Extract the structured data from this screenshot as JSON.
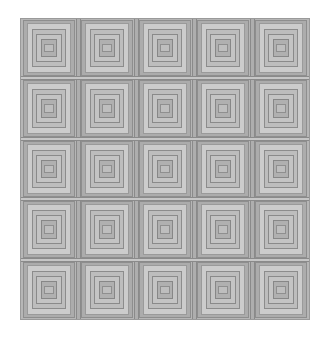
{
  "image": {
    "title": "Tiled nested-square grayscale pattern",
    "background_color": "#ffffff",
    "width": 329,
    "height": 338
  },
  "pattern": {
    "name": "nested-square-tiling",
    "columns": 5,
    "rows": 5,
    "origin_x": 20,
    "origin_y": 18,
    "area_width": 290,
    "area_height": 302,
    "tile_width": 58,
    "tile_height": 60.4,
    "border_color": "#9a9a9a",
    "base_color": "#b4b4b4",
    "seam_color_vertical": "#aeaeae",
    "seam_color_horizontal": "#c6c6c6",
    "outline_color": "#8e8e8e"
  },
  "tile_bands": [
    {
      "name": "outer-field",
      "inset_x": 0,
      "inset_y": 0,
      "color": "#b6b6b6",
      "outline": "#949494"
    },
    {
      "name": "outer-frame",
      "inset_x": 3,
      "inset_y": 2,
      "color": "#acacac",
      "outline": "#8e8e8e"
    },
    {
      "name": "light-cap",
      "inset_x": 7,
      "inset_y": 5,
      "color": "#cccccc",
      "outline": "#9a9a9a"
    },
    {
      "name": "mid-frame",
      "inset_x": 12,
      "inset_y": 11,
      "color": "#bdbdbd",
      "outline": "#8c8c8c"
    },
    {
      "name": "inner-frame",
      "inset_x": 16,
      "inset_y": 16,
      "color": "#c4c4c4",
      "outline": "#8a8a8a"
    },
    {
      "name": "core-square",
      "inset_x": 21,
      "inset_y": 21,
      "color": "#b0b0b0",
      "outline": "#878787"
    },
    {
      "name": "core-highlight",
      "inset_x": 24,
      "inset_y": 26,
      "color": "#bebebe",
      "outline": "#8f8f8f"
    }
  ],
  "seams": {
    "vertical_width": 5,
    "horizontal_height": 4,
    "vertical_positions": [
      58,
      116,
      174,
      232
    ],
    "horizontal_positions": [
      60.4,
      120.8,
      181.2,
      241.6
    ]
  },
  "labels": {
    "canvas": "pattern-canvas",
    "grid": "pattern-grid",
    "tile": "pattern-tile"
  }
}
